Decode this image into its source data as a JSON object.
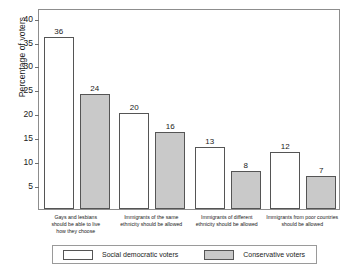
{
  "chart_data": {
    "type": "bar",
    "title": "",
    "subtitle": "",
    "xlabel": "",
    "ylabel": "Percentage of voters",
    "ylim": [
      0,
      42
    ],
    "yticks": [
      5,
      10,
      15,
      20,
      25,
      30,
      35,
      40
    ],
    "ytick_labels": [
      "5",
      "10",
      "15",
      "20",
      "25",
      "30",
      "35",
      "40"
    ],
    "grid": false,
    "legend_position": "bottom",
    "grouped": true,
    "categories": [
      "Gays and lesbians\nshould be able to live\nhow they choose",
      "Immigrants of the same\nethnicity should be allowed",
      "Immigrants of different\nethnicity should be allowed",
      "Immigrants from poor countries\nshould be allowed"
    ],
    "series": [
      {
        "name": "Social democratic voters",
        "color": "#ffffff",
        "edge_color": "#555555",
        "values": [
          36,
          20,
          13,
          12
        ],
        "value_labels": [
          "36",
          "20",
          "13",
          "12"
        ]
      },
      {
        "name": "Conservative voters",
        "color": "#c9c9c9",
        "edge_color": "#555555",
        "values": [
          24,
          16,
          8,
          7
        ],
        "value_labels": [
          "24",
          "16",
          "8",
          "7"
        ]
      }
    ]
  },
  "legend": {
    "entries": [
      {
        "label": "Social democratic voters"
      },
      {
        "label": "Conservative voters"
      }
    ]
  },
  "colors": {
    "series_white": "#ffffff",
    "series_gray": "#c9c9c9",
    "frame": "#8d8d8d",
    "text": "#1a1a1a",
    "background": "#ffffff"
  }
}
